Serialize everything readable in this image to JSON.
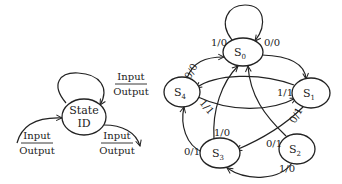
{
  "legend_diagram": {
    "state_label_line1": "State",
    "state_label_line2": "ID",
    "self_loop": {
      "input": "Input",
      "output": "Output"
    },
    "incoming": {
      "input": "Input",
      "output": "Output"
    },
    "outgoing": {
      "input": "Input",
      "output": "Output"
    }
  },
  "fsm": {
    "states": [
      {
        "id": "S0",
        "label": "S",
        "sub": "0"
      },
      {
        "id": "S1",
        "label": "S",
        "sub": "1"
      },
      {
        "id": "S2",
        "label": "S",
        "sub": "2"
      },
      {
        "id": "S3",
        "label": "S",
        "sub": "3"
      },
      {
        "id": "S4",
        "label": "S",
        "sub": "4"
      }
    ],
    "transitions": [
      {
        "from": "S0",
        "to": "S0",
        "label": "1/0"
      },
      {
        "from": "S0",
        "to": "S1",
        "label": "0/0"
      },
      {
        "from": "S4",
        "to": "S0",
        "label": "0/0"
      },
      {
        "from": "S1",
        "to": "S4",
        "label": "1/1"
      },
      {
        "from": "S4",
        "to": "S1",
        "label": "1/1"
      },
      {
        "from": "S1",
        "to": "S3",
        "label": "0/1"
      },
      {
        "from": "S3",
        "to": "S0",
        "label": "1/0"
      },
      {
        "from": "S3",
        "to": "S4",
        "label": "0/1"
      },
      {
        "from": "S2",
        "to": "S0",
        "label": "0/1"
      },
      {
        "from": "S2",
        "to": "S3",
        "label": "1/0"
      }
    ]
  }
}
